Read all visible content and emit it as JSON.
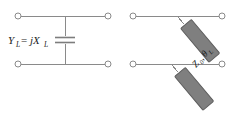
{
  "figure": {
    "background_color": "#ffffff",
    "wire_color": "#8a8a8a",
    "stub_fill_color": "#7f7f7f",
    "stub_edge_color": "#5d5d5d",
    "text_color": "#1c1c1c",
    "width": 240,
    "height": 118
  },
  "left_circuit": {
    "name": "shunt-capacitor-network",
    "label": {
      "symbol": "Y",
      "symbol_subscript": "L",
      "operator": "=",
      "value": "jX",
      "value_subscript": "L",
      "full_text": "Y_L = jX_L"
    },
    "element": {
      "type": "capacitor",
      "orientation": "shunt",
      "plates": 2
    },
    "terminals": [
      {
        "name": "top-left-terminal",
        "position": "top-left"
      },
      {
        "name": "top-right-terminal",
        "position": "top-right"
      },
      {
        "name": "bottom-left-terminal",
        "position": "bottom-left"
      },
      {
        "name": "bottom-right-terminal",
        "position": "bottom-right"
      }
    ]
  },
  "right_circuit": {
    "name": "transmission-line-stub-network",
    "label": {
      "impedance": "Z",
      "impedance_subscript": "0",
      "separator": ",",
      "angle": "θ",
      "angle_subscript": "L",
      "full_text": "Z0, θL"
    },
    "elements": [
      {
        "type": "transmission-line-stub",
        "orientation": "diagonal",
        "position": "upper"
      },
      {
        "type": "transmission-line-stub",
        "orientation": "diagonal",
        "position": "lower"
      }
    ],
    "terminals": [
      {
        "name": "top-left-terminal",
        "position": "top-left"
      },
      {
        "name": "top-right-terminal",
        "position": "top-right"
      },
      {
        "name": "bottom-left-terminal",
        "position": "bottom-left"
      },
      {
        "name": "bottom-right-terminal",
        "position": "bottom-right"
      }
    ]
  }
}
